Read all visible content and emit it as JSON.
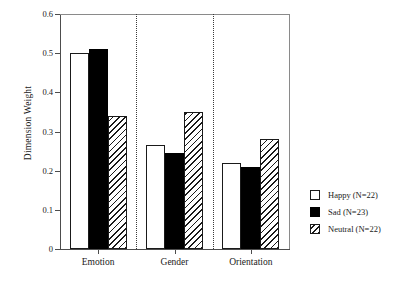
{
  "chart_data": {
    "type": "bar",
    "title": "",
    "subtitle": "",
    "xlabel": "",
    "ylabel": "Dimension Weight",
    "categories": [
      "Emotion",
      "Gender",
      "Orientation"
    ],
    "series": [
      {
        "name": "Happy (N=22)",
        "key": "happy",
        "fill": "white",
        "values": [
          0.5,
          0.265,
          0.22
        ]
      },
      {
        "name": "Sad (N=23)",
        "key": "sad",
        "fill": "black",
        "values": [
          0.51,
          0.245,
          0.21
        ]
      },
      {
        "name": "Neutral (N=22)",
        "key": "neutral",
        "fill": "hatched",
        "values": [
          0.34,
          0.35,
          0.28
        ]
      }
    ],
    "ylim": [
      0,
      0.6
    ],
    "yticks": [
      0,
      0.1,
      0.2,
      0.3,
      0.4,
      0.5,
      0.6
    ],
    "ytick_labels": [
      "0",
      "0.1",
      "0.2",
      "0.3",
      "0.4",
      "0.5",
      "0.6"
    ],
    "grid": false,
    "legend_position": "right",
    "group_separators": true,
    "colors": {
      "axis": "#4d4d4d",
      "frame": "#8a8a8a",
      "bar_outline": "#1a1a1a",
      "bar_fill_black": "#000000",
      "bar_fill_white": "#ffffff",
      "text": "#1a1a1a",
      "separator": "#3a3a3a"
    }
  },
  "legend": {
    "items": [
      {
        "label": "Happy (N=22)",
        "swatch": "white-square-icon"
      },
      {
        "label": "Sad (N=23)",
        "swatch": "black-square-icon"
      },
      {
        "label": "Neutral (N=22)",
        "swatch": "hatched-square-icon"
      }
    ]
  }
}
